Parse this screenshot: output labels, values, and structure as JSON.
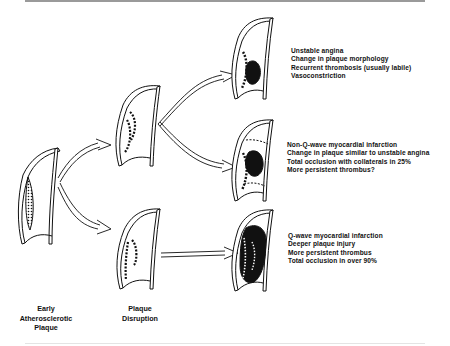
{
  "figure": {
    "stages": [
      {
        "id": "early",
        "label_lines": [
          "Early",
          "Atherosclerotic",
          "Plaque"
        ]
      },
      {
        "id": "disruption",
        "label_lines": [
          "Plaque",
          "Disruption"
        ]
      }
    ],
    "outcomes": [
      {
        "id": "unstable-angina",
        "lines": [
          "Unstable angina",
          "Change in plaque morphology",
          "Recurrent thrombosis (usually labile)",
          "Vasoconstriction"
        ]
      },
      {
        "id": "non-q-wave-mi",
        "lines": [
          "Non-Q-wave myocardial infarction",
          "Change in plaque similar to unstable angina",
          "Total occlusion with collaterals in 25%",
          "More persistent thrombus?"
        ]
      },
      {
        "id": "q-wave-mi",
        "lines": [
          "Q-wave myocardial infarction",
          "Deeper plaque injury",
          "More persistent thrombus",
          "Total occlusion in over 90%"
        ]
      }
    ],
    "colors": {
      "ink": "#111111",
      "rule": "#9a9a9a",
      "background": "#ffffff"
    }
  }
}
